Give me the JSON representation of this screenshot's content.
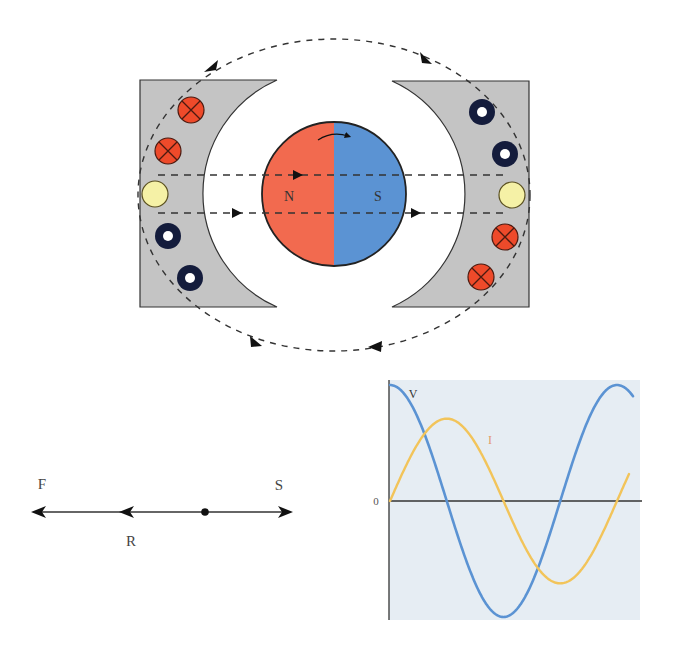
{
  "generator": {
    "rotor": {
      "north_label": "N",
      "south_label": "S",
      "north_color": "#F26A4F",
      "south_color": "#5B93D3"
    },
    "stator_color": "#C4C4C4",
    "conductors": {
      "into_page_color": "#EE4A2A",
      "out_of_page_color": "#141C3C",
      "neutral_color": "#F5F1A6",
      "left": [
        "into",
        "into",
        "neutral",
        "out",
        "out"
      ],
      "right": [
        "out",
        "out",
        "neutral",
        "into",
        "into"
      ]
    }
  },
  "phasor": {
    "labels": {
      "f": "F",
      "s": "S",
      "r": "R"
    }
  },
  "chart_data": {
    "type": "line",
    "title": "",
    "xlabel": "",
    "ylabel": "",
    "y_tick_labels": [
      "0"
    ],
    "background": "#E6EDF3",
    "series": [
      {
        "name": "V",
        "color": "#5B93D3",
        "function": "cosine",
        "amplitude": 1.0,
        "phase_deg": 0,
        "cycles_shown": 1.08
      },
      {
        "name": "I",
        "color": "#F2C45A",
        "label_color": "#E39A6A",
        "function": "sine",
        "amplitude": 0.71,
        "phase_deg": -90,
        "cycles_shown": 1.05
      }
    ],
    "x": [
      0,
      45,
      90,
      135,
      180,
      225,
      270,
      315,
      360
    ],
    "V_values": [
      1.0,
      0.71,
      0.0,
      -0.71,
      -1.0,
      -0.71,
      0.0,
      0.71,
      1.0
    ],
    "I_values": [
      0.0,
      0.5,
      0.71,
      0.5,
      0.0,
      -0.5,
      -0.71,
      -0.5,
      0.0
    ],
    "grid": false,
    "legend": "inline labels"
  }
}
